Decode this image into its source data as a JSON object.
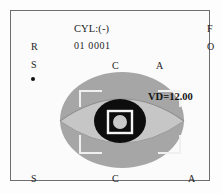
{
  "device": {
    "screen_title": "Autorefractor measurement view"
  },
  "header": {
    "cylinder_mode": "CYL:(-)",
    "reading_id": "01  0001"
  },
  "mode_indicators": {
    "f_label": "F",
    "o_label": "O"
  },
  "eye_side": {
    "r_label": "R",
    "s_label": "S",
    "active_dot": "active-indicator-dot"
  },
  "top_axis": {
    "c_label": "C",
    "a_label": "A"
  },
  "measurement": {
    "vertex_distance": "VD=12.00"
  },
  "bottom_axis": {
    "s_label": "S",
    "c_label": "C",
    "a_label": "A"
  },
  "eye_graphic": {
    "name": "eye-alignment-graphic",
    "iris_color": "#a6a6a6",
    "sclera_color": "#bdbdbd",
    "pupil_color": "#111111",
    "reticle_color": "#f2f2f2",
    "inner_highlight_color": "#c9c9c9"
  },
  "colors": {
    "frame_border": "#6d6d72",
    "background": "#fbfbfb",
    "text": "#1c1c1c"
  }
}
